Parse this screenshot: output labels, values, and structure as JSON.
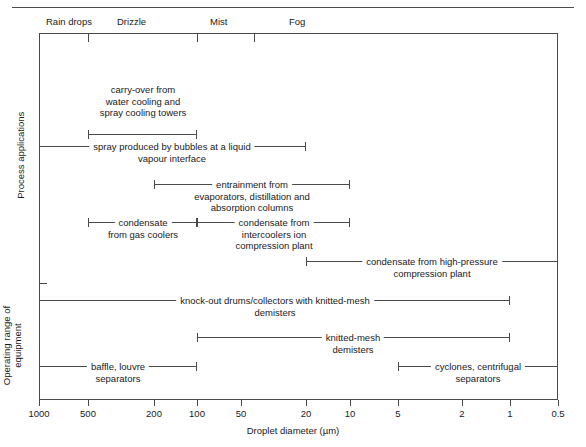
{
  "chart_data": {
    "type": "bar",
    "title": "",
    "xlabel": "Droplet diameter (µm)",
    "ylabel": "",
    "xscale": "log-reversed",
    "xlim": [
      1000,
      0.5
    ],
    "grid": false,
    "legend": "none",
    "axis_ticks": [
      {
        "label": "1000",
        "value": 1000,
        "x": 39
      },
      {
        "label": "500",
        "value": 500,
        "x": 88
      },
      {
        "label": "200",
        "value": 200,
        "x": 154
      },
      {
        "label": "100",
        "value": 100,
        "x": 197
      },
      {
        "label": "50",
        "value": 50,
        "x": 241
      },
      {
        "label": "20",
        "value": 20,
        "x": 306
      },
      {
        "label": "10",
        "value": 10,
        "x": 350
      },
      {
        "label": "5",
        "value": 5,
        "x": 398
      },
      {
        "label": "2",
        "value": 2,
        "x": 462
      },
      {
        "label": "1",
        "value": 1,
        "x": 510
      },
      {
        "label": "0.5",
        "value": 0.5,
        "x": 558
      }
    ],
    "classification_bands": [
      {
        "label": "Rain drops",
        "label_x": 46,
        "tick_x": 88,
        "range": [
          1000,
          500
        ]
      },
      {
        "label": "Drizzle",
        "label_x": 117,
        "tick_x": 197,
        "range": [
          500,
          100
        ]
      },
      {
        "label": "Mist",
        "label_x": 210,
        "tick_x": 254,
        "range": [
          100,
          35
        ]
      },
      {
        "label": "Fog",
        "label_x": 289,
        "tick_x": null,
        "range": [
          35,
          0.5
        ]
      }
    ],
    "groups": [
      {
        "name": "Process applications",
        "label": "Process applications",
        "bars": [
          {
            "label": "carry-over from\nwater cooling and\nspray cooling towers",
            "from": 500,
            "to": 100,
            "x1": 88,
            "x2": 197,
            "y": 134,
            "label_anchor_x": 143,
            "label_top": 84,
            "label_lines": 3,
            "label_style": "above"
          },
          {
            "label": "spray produced by bubbles at a liquid\nvapour interface",
            "from": 1000,
            "to": 20,
            "x1": 39,
            "x2": 306,
            "y": 146,
            "label_anchor_x": 172,
            "label_top": 141,
            "label_lines": 2,
            "label_style": "on-line"
          },
          {
            "label": "entrainment from\nevaporators, distillation and\nabsorption columns",
            "from": 200,
            "to": 10,
            "x1": 154,
            "x2": 350,
            "y": 184,
            "label_anchor_x": 252,
            "label_top": 179,
            "label_lines": 3,
            "label_style": "on-line"
          },
          {
            "label": "condensate\nfrom gas coolers",
            "from": 500,
            "to": 100,
            "x1": 88,
            "x2": 197,
            "y": 222,
            "label_anchor_x": 143,
            "label_top": 217,
            "label_lines": 2,
            "label_style": "on-line"
          },
          {
            "label": "condensate from\nintercoolers ion\ncompression plant",
            "from": 100,
            "to": 10,
            "x1": 197,
            "x2": 350,
            "y": 222,
            "label_anchor_x": 274,
            "label_top": 217,
            "label_lines": 3,
            "label_style": "on-line"
          },
          {
            "label": "condensate from high-pressure\ncompression plant",
            "from": 20,
            "to": 0.5,
            "x1": 306,
            "x2": 558,
            "y": 261,
            "label_anchor_x": 432,
            "label_top": 256,
            "label_lines": 2,
            "label_style": "on-line"
          }
        ]
      },
      {
        "name": "Operating range of equipment",
        "label": "Operating range of\nequipment",
        "bars": [
          {
            "label": "knock-out drums/collectors with knitted-mesh\ndemisters",
            "from": 1000,
            "to": 1,
            "x1": 39,
            "x2": 510,
            "y": 300,
            "label_anchor_x": 275,
            "label_top": 295,
            "label_lines": 2,
            "label_style": "on-line"
          },
          {
            "label": "knitted-mesh\ndemisters",
            "from": 100,
            "to": 1,
            "x1": 197,
            "x2": 510,
            "y": 337,
            "label_anchor_x": 353,
            "label_top": 332,
            "label_lines": 2,
            "label_style": "on-line"
          },
          {
            "label": "baffle, louvre\nseparators",
            "from": 1000,
            "to": 100,
            "x1": 39,
            "x2": 197,
            "y": 366,
            "label_anchor_x": 118,
            "label_top": 361,
            "label_lines": 2,
            "label_style": "on-line"
          },
          {
            "label": "cyclones, centrifugal\nseparators",
            "from": 5,
            "to": 0.5,
            "x1": 398,
            "x2": 558,
            "y": 366,
            "label_anchor_x": 478,
            "label_top": 361,
            "label_lines": 2,
            "label_style": "on-line"
          }
        ]
      }
    ],
    "colors": {
      "line": "#4a4a4a",
      "text": "#1a1a1a",
      "background": "#ffffff"
    }
  }
}
